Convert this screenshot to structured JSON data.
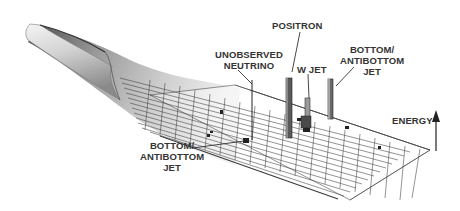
{
  "diagram": {
    "type": "detector-event-display-lego-plot",
    "colors": {
      "background": "#ffffff",
      "grid_line": "#3a3a3a",
      "tube_light": "#e8e8e8",
      "tube_dark": "#6e6e6e",
      "tower": "#555555",
      "label_text": "#333333"
    },
    "labels": {
      "positron": "POSITRON",
      "unobserved_neutrino": [
        "UNOBSERVED",
        "NEUTRINO"
      ],
      "w_jet": "W JET",
      "bottom_jet_right": [
        "BOTTOM/",
        "ANTIBOTTOM",
        "JET"
      ],
      "bottom_jet_left": [
        "BOTTOM/",
        "ANTIBOTTOM",
        "JET"
      ],
      "energy_axis": "ENERGY"
    }
  }
}
